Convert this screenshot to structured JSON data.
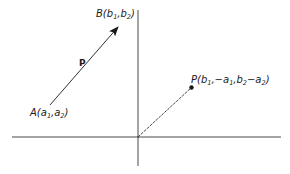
{
  "diagram": {
    "type": "vector-translation",
    "colors": {
      "ink": "#1a1a1a",
      "background": "#ffffff"
    },
    "axes": {
      "x_axis": "horizontal axis",
      "y_axis": "vertical axis"
    },
    "points": {
      "A": {
        "letter": "A",
        "coords": [
          "a",
          "1",
          "a",
          "2"
        ],
        "label_parts": [
          "A(",
          "a",
          "1",
          ",",
          "a",
          "2",
          ")"
        ]
      },
      "B": {
        "letter": "B",
        "coords": [
          "b",
          "1",
          "b",
          "2"
        ],
        "label_parts": [
          "B(",
          "b",
          "1",
          ",",
          "b",
          "2",
          ")"
        ]
      },
      "P": {
        "letter": "P",
        "label_parts": [
          "P(",
          "b",
          "1",
          ",−",
          "a",
          "1",
          ",",
          "b",
          "2",
          "−",
          "a",
          "2",
          ")"
        ]
      }
    },
    "vector_label": "P",
    "vector_from": "A",
    "vector_to": "B",
    "position_vector_from": "origin",
    "position_vector_to": "P"
  }
}
